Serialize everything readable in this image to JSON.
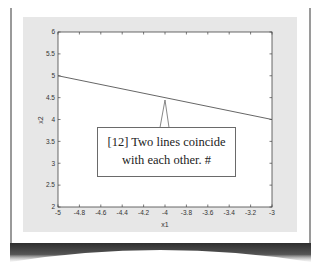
{
  "chart_data": {
    "type": "line",
    "title": "",
    "xlabel": "x1",
    "ylabel": "x2",
    "xlim": [
      -5,
      -3
    ],
    "ylim": [
      2,
      6
    ],
    "grid": false,
    "x_ticks": [
      "-5",
      "-4.8",
      "-4.6",
      "-4.4",
      "-4.2",
      "-4",
      "-3.8",
      "-3.6",
      "-3.4",
      "-3.2",
      "-3"
    ],
    "y_ticks": [
      "2",
      "2.5",
      "3",
      "3.5",
      "4",
      "4.5",
      "5",
      "5.5",
      "6"
    ],
    "series": [
      {
        "name": "line",
        "x": [
          -5,
          -3
        ],
        "y": [
          5,
          4
        ],
        "color": "#555555"
      }
    ],
    "annotations": [
      {
        "text_lines": [
          "[12] Two lines coincide",
          "with each other.  #"
        ],
        "point_x": -4,
        "point_y": 4.5
      }
    ]
  },
  "annotation": {
    "line1": "[12] Two lines coincide",
    "line2": "with each other.  #"
  },
  "axes": {
    "xlabel": "x1",
    "ylabel": "x2"
  },
  "colors": {
    "figure_background": "#e7e7e7",
    "axes_background": "#ffffff",
    "line": "#555555",
    "axis": "#444444",
    "page_shadow": "#3a3a3a"
  }
}
